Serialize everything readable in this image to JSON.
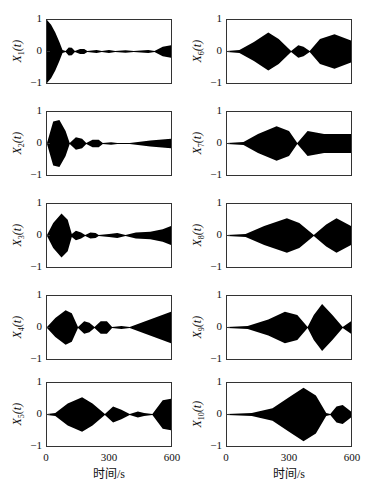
{
  "chart_data": [
    {
      "type": "area",
      "title": "",
      "ylabel": "X1(t)",
      "label_main": "X",
      "label_sub": "1",
      "label_tail": "(t)",
      "xlim": [
        0,
        600
      ],
      "ylim": [
        -1,
        1
      ],
      "envelope": [
        [
          0,
          1.0
        ],
        [
          20,
          0.85
        ],
        [
          40,
          0.6
        ],
        [
          60,
          0.3
        ],
        [
          75,
          0.05
        ],
        [
          90,
          0.02
        ],
        [
          105,
          0.13
        ],
        [
          120,
          0.12
        ],
        [
          135,
          0.02
        ],
        [
          160,
          0.08
        ],
        [
          180,
          0.08
        ],
        [
          195,
          0.02
        ],
        [
          240,
          0.05
        ],
        [
          265,
          0.02
        ],
        [
          300,
          0.05
        ],
        [
          330,
          0.02
        ],
        [
          380,
          0.04
        ],
        [
          420,
          0.02
        ],
        [
          490,
          0.05
        ],
        [
          520,
          0.02
        ],
        [
          560,
          0.15
        ],
        [
          600,
          0.2
        ]
      ]
    },
    {
      "type": "area",
      "ylabel": "X2(t)",
      "label_main": "X",
      "label_sub": "2",
      "label_tail": "(t)",
      "xlim": [
        0,
        600
      ],
      "ylim": [
        -1,
        1
      ],
      "envelope": [
        [
          0,
          0.02
        ],
        [
          30,
          0.7
        ],
        [
          60,
          0.75
        ],
        [
          90,
          0.4
        ],
        [
          110,
          0.02
        ],
        [
          140,
          0.2
        ],
        [
          170,
          0.15
        ],
        [
          190,
          0.02
        ],
        [
          220,
          0.12
        ],
        [
          250,
          0.12
        ],
        [
          270,
          0.02
        ],
        [
          310,
          0.04
        ],
        [
          340,
          0.02
        ],
        [
          400,
          0.02
        ],
        [
          500,
          0.1
        ],
        [
          600,
          0.15
        ]
      ]
    },
    {
      "type": "area",
      "ylabel": "X3(t)",
      "label_main": "X",
      "label_sub": "3",
      "label_tail": "(t)",
      "xlim": [
        0,
        600
      ],
      "ylim": [
        -1,
        1
      ],
      "envelope": [
        [
          0,
          0.02
        ],
        [
          30,
          0.4
        ],
        [
          70,
          0.7
        ],
        [
          100,
          0.5
        ],
        [
          120,
          0.05
        ],
        [
          140,
          0.15
        ],
        [
          165,
          0.1
        ],
        [
          185,
          0.02
        ],
        [
          210,
          0.1
        ],
        [
          235,
          0.08
        ],
        [
          250,
          0.02
        ],
        [
          300,
          0.05
        ],
        [
          340,
          0.08
        ],
        [
          380,
          0.02
        ],
        [
          430,
          0.1
        ],
        [
          500,
          0.12
        ],
        [
          560,
          0.2
        ],
        [
          600,
          0.3
        ]
      ]
    },
    {
      "type": "area",
      "ylabel": "X4(t)",
      "label_main": "X",
      "label_sub": "4",
      "label_tail": "(t)",
      "xlim": [
        0,
        600
      ],
      "ylim": [
        -1,
        1
      ],
      "envelope": [
        [
          0,
          0.02
        ],
        [
          40,
          0.3
        ],
        [
          90,
          0.55
        ],
        [
          120,
          0.45
        ],
        [
          150,
          0.02
        ],
        [
          180,
          0.2
        ],
        [
          205,
          0.15
        ],
        [
          230,
          0.02
        ],
        [
          260,
          0.2
        ],
        [
          290,
          0.2
        ],
        [
          315,
          0.02
        ],
        [
          360,
          0.05
        ],
        [
          400,
          0.02
        ],
        [
          600,
          0.5
        ]
      ]
    },
    {
      "type": "area",
      "ylabel": "X5(t)",
      "label_main": "X",
      "label_sub": "5",
      "label_tail": "(t)",
      "xlim": [
        0,
        600
      ],
      "ylim": [
        -1,
        1
      ],
      "envelope": [
        [
          0,
          0.02
        ],
        [
          40,
          0.05
        ],
        [
          100,
          0.35
        ],
        [
          170,
          0.55
        ],
        [
          220,
          0.35
        ],
        [
          280,
          0.02
        ],
        [
          320,
          0.25
        ],
        [
          360,
          0.15
        ],
        [
          400,
          0.02
        ],
        [
          440,
          0.1
        ],
        [
          470,
          0.05
        ],
        [
          510,
          0.02
        ],
        [
          560,
          0.45
        ],
        [
          600,
          0.5
        ]
      ]
    },
    {
      "type": "area",
      "ylabel": "X6(t)",
      "label_main": "X",
      "label_sub": "6",
      "label_tail": "(t)",
      "xlim": [
        0,
        600
      ],
      "ylim": [
        -1,
        1
      ],
      "envelope": [
        [
          0,
          0.02
        ],
        [
          60,
          0.05
        ],
        [
          130,
          0.3
        ],
        [
          200,
          0.6
        ],
        [
          250,
          0.4
        ],
        [
          310,
          0.02
        ],
        [
          345,
          0.2
        ],
        [
          370,
          0.15
        ],
        [
          400,
          0.02
        ],
        [
          450,
          0.4
        ],
        [
          520,
          0.55
        ],
        [
          600,
          0.35
        ]
      ]
    },
    {
      "type": "area",
      "ylabel": "X7(t)",
      "label_main": "X",
      "label_sub": "7",
      "label_tail": "(t)",
      "xlim": [
        0,
        600
      ],
      "ylim": [
        -1,
        1
      ],
      "envelope": [
        [
          0,
          0.02
        ],
        [
          80,
          0.05
        ],
        [
          150,
          0.3
        ],
        [
          240,
          0.55
        ],
        [
          300,
          0.4
        ],
        [
          340,
          0.02
        ],
        [
          390,
          0.4
        ],
        [
          430,
          0.35
        ],
        [
          470,
          0.3
        ],
        [
          600,
          0.3
        ]
      ]
    },
    {
      "type": "area",
      "ylabel": "X8(t)",
      "label_main": "X",
      "label_sub": "8",
      "label_tail": "(t)",
      "xlim": [
        0,
        600
      ],
      "ylim": [
        -1,
        1
      ],
      "envelope": [
        [
          0,
          0.02
        ],
        [
          90,
          0.05
        ],
        [
          180,
          0.3
        ],
        [
          290,
          0.55
        ],
        [
          350,
          0.4
        ],
        [
          420,
          0.02
        ],
        [
          480,
          0.35
        ],
        [
          530,
          0.55
        ],
        [
          600,
          0.3
        ]
      ]
    },
    {
      "type": "area",
      "ylabel": "X9(t)",
      "label_main": "X",
      "label_sub": "9",
      "label_tail": "(t)",
      "xlim": [
        0,
        600
      ],
      "ylim": [
        -1,
        1
      ],
      "envelope": [
        [
          0,
          0.02
        ],
        [
          100,
          0.05
        ],
        [
          200,
          0.25
        ],
        [
          280,
          0.5
        ],
        [
          340,
          0.4
        ],
        [
          390,
          0.02
        ],
        [
          420,
          0.4
        ],
        [
          460,
          0.75
        ],
        [
          510,
          0.4
        ],
        [
          560,
          0.02
        ],
        [
          600,
          0.2
        ]
      ]
    },
    {
      "type": "area",
      "ylabel": "X10(t)",
      "label_main": "X",
      "label_sub": "10",
      "label_tail": "(t)",
      "xlim": [
        0,
        600
      ],
      "ylim": [
        -1,
        1
      ],
      "envelope": [
        [
          0,
          0.02
        ],
        [
          120,
          0.05
        ],
        [
          220,
          0.2
        ],
        [
          300,
          0.55
        ],
        [
          370,
          0.85
        ],
        [
          430,
          0.6
        ],
        [
          480,
          0.05
        ],
        [
          500,
          0.02
        ],
        [
          530,
          0.25
        ],
        [
          560,
          0.3
        ],
        [
          600,
          0.1
        ]
      ]
    }
  ],
  "axes": {
    "yticks": [
      "1",
      "0",
      "−1"
    ],
    "xticks": [
      "0",
      "300",
      "600"
    ],
    "xlabel": "时间/s"
  }
}
